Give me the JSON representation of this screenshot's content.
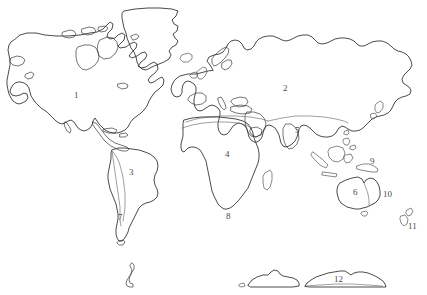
{
  "page": {
    "background_color": "#ffffff",
    "outline_color": "#2b2b2b",
    "label_color": "#4a4a4a",
    "width": 427,
    "height": 295
  },
  "map": {
    "projection_note": "flat world outline, continents only, no graticule",
    "labels": [
      {
        "id": "1",
        "text": "1",
        "x": 74,
        "y": 91,
        "region": "north-america"
      },
      {
        "id": "2",
        "text": "2",
        "x": 283,
        "y": 84,
        "region": "northern-eurasia"
      },
      {
        "id": "3",
        "text": "3",
        "x": 129,
        "y": 168,
        "region": "south-america"
      },
      {
        "id": "4",
        "text": "4",
        "x": 225,
        "y": 150,
        "region": "africa"
      },
      {
        "id": "5",
        "text": "5",
        "x": 295,
        "y": 126,
        "region": "southern-asia"
      },
      {
        "id": "6",
        "text": "6",
        "x": 353,
        "y": 188,
        "region": "australia"
      },
      {
        "id": "7",
        "text": "7",
        "x": 118,
        "y": 213,
        "region": "southern-south-america"
      },
      {
        "id": "8",
        "text": "8",
        "x": 226,
        "y": 212,
        "region": "southern-africa"
      },
      {
        "id": "9",
        "text": "9",
        "x": 370,
        "y": 157,
        "region": "new-guinea"
      },
      {
        "id": "10",
        "text": "10",
        "x": 383,
        "y": 190,
        "region": "eastern-australia"
      },
      {
        "id": "11",
        "text": "11",
        "x": 408,
        "y": 222,
        "region": "new-zealand"
      },
      {
        "id": "12",
        "text": "12",
        "x": 334,
        "y": 275,
        "region": "antarctica"
      }
    ],
    "landmasses": [
      {
        "name": "north-america"
      },
      {
        "name": "greenland"
      },
      {
        "name": "iceland"
      },
      {
        "name": "central-america"
      },
      {
        "name": "caribbean-islands"
      },
      {
        "name": "south-america"
      },
      {
        "name": "eurasia"
      },
      {
        "name": "british-isles"
      },
      {
        "name": "africa"
      },
      {
        "name": "madagascar"
      },
      {
        "name": "arabian-peninsula"
      },
      {
        "name": "indian-subcontinent"
      },
      {
        "name": "southeast-asia-islands"
      },
      {
        "name": "japan"
      },
      {
        "name": "philippines"
      },
      {
        "name": "new-guinea"
      },
      {
        "name": "australia"
      },
      {
        "name": "new-zealand"
      },
      {
        "name": "antarctica"
      },
      {
        "name": "antarctic-peninsula"
      }
    ]
  }
}
